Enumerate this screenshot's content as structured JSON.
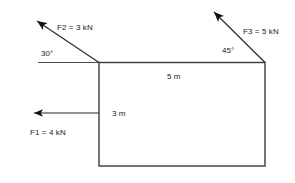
{
  "figure": {
    "type": "statics-free-body-diagram",
    "stroke_color": "#2b2b2b",
    "text_color": "#1a1a1a",
    "background": "#ffffff"
  },
  "body": {
    "shape": "rectangle",
    "width_label": "5 m",
    "height_label": "3 m"
  },
  "dimensions": [
    {
      "name": "top-width",
      "text": "5 m"
    },
    {
      "name": "left-height",
      "text": "3 m"
    }
  ],
  "forces": [
    {
      "id": "F1",
      "label": "F1 = 4 kN",
      "magnitude": 4,
      "unit": "kN",
      "direction": "horizontal-left",
      "angle_text": ""
    },
    {
      "id": "F2",
      "label": "F2 = 3 kN",
      "magnitude": 3,
      "unit": "kN",
      "direction": "up-left",
      "angle_text": "30°"
    },
    {
      "id": "F3",
      "label": "F3 = 5 kN",
      "magnitude": 5,
      "unit": "kN",
      "direction": "up-left",
      "angle_text": "45°"
    }
  ],
  "angles": [
    {
      "name": "angle-f2",
      "text": "30°"
    },
    {
      "name": "angle-f3",
      "text": "45°"
    }
  ]
}
